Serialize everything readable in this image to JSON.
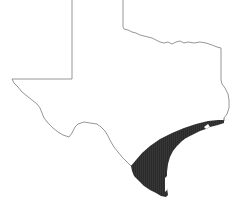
{
  "map": {
    "subject": "Texas",
    "highlighted_region": "Gulf coastal plain / South Texas coastal region",
    "colors": {
      "background": "#ffffff",
      "outline": "#8a8a8a",
      "shade": "#2b2b2b",
      "hatch": "#3a3a3a"
    },
    "legend": []
  }
}
